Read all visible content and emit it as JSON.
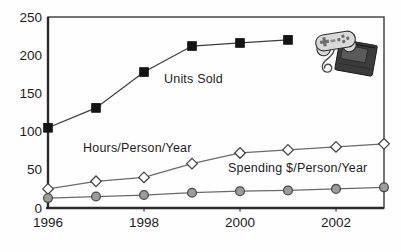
{
  "figure": {
    "background_color": "#fefefe",
    "clipart": "game-controller-and-cartridge"
  },
  "chart_data": {
    "type": "line",
    "title": "",
    "xlabel": "",
    "ylabel": "",
    "xlim": [
      1996,
      2003
    ],
    "ylim": [
      0,
      250
    ],
    "xticks": [
      "1996",
      "1998",
      "2000",
      "2002"
    ],
    "yticks": [
      "0",
      "50",
      "100",
      "150",
      "200",
      "250"
    ],
    "grid": false,
    "legend_position": "inline-labels",
    "axis_color": "#2b2b2b",
    "frame_color": "#3a3a3a",
    "text_color": "#1c1c1c",
    "series": [
      {
        "id": "units-sold",
        "name": "Units Sold",
        "marker": "square",
        "marker_fill": "#141414",
        "marker_stroke": "#141414",
        "line_color": "#3c3c3c",
        "x": [
          1996,
          1997,
          1998,
          1999,
          2000,
          2001
        ],
        "values": [
          105,
          131,
          178,
          212,
          216,
          220
        ]
      },
      {
        "id": "hours-per-person-year",
        "name": "Hours/Person/Year",
        "marker": "diamond",
        "marker_fill": "#ffffff",
        "marker_stroke": "#3c3c3c",
        "line_color": "#6a6a6a",
        "x": [
          1996,
          1997,
          1998,
          1999,
          2000,
          2001,
          2002,
          2003
        ],
        "values": [
          25,
          35,
          40,
          58,
          72,
          76,
          80,
          84
        ]
      },
      {
        "id": "spending-per-person-year",
        "name": "Spending $/Person/Year",
        "marker": "circle",
        "marker_fill": "#9c9c9c",
        "marker_stroke": "#4a4a4a",
        "line_color": "#6a6a6a",
        "x": [
          1996,
          1997,
          1998,
          1999,
          2000,
          2001,
          2002,
          2003
        ],
        "values": [
          13,
          15,
          17,
          20,
          22,
          23,
          25,
          27
        ]
      }
    ]
  }
}
